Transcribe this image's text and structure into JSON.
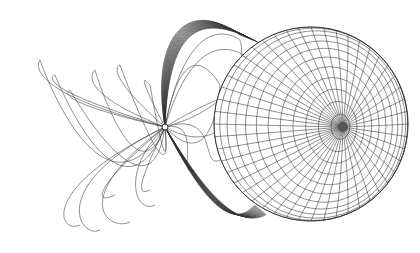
{
  "figure": {
    "colors": {
      "background": "#ffffff",
      "line": "#333333",
      "ribbon": "#444444"
    },
    "sphere": {
      "cx": 311,
      "cy": 124,
      "r": 97,
      "pole_x": 343,
      "pole_y": 127
    },
    "small_body": {
      "cx": 165,
      "cy": 127,
      "r": 3
    }
  }
}
